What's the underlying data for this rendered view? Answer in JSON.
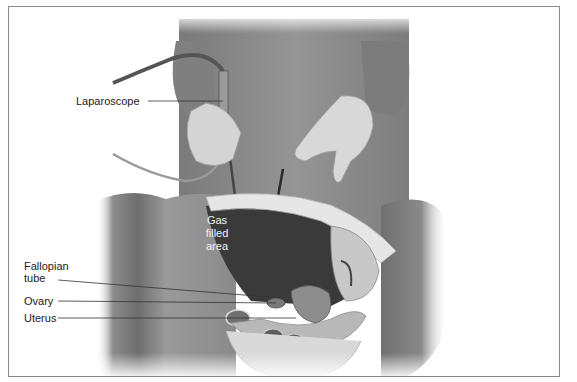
{
  "figure": {
    "caption_partial": "",
    "border_color": "#8a8a8a",
    "background": "#ffffff"
  },
  "labels": {
    "laparoscope": "Laparoscope",
    "gas_line1": "Gas",
    "gas_line2": "filled",
    "gas_line3": "area",
    "fallopian_line1": "Fallopian",
    "fallopian_line2": "tube",
    "ovary": "Ovary",
    "uterus": "Uterus"
  },
  "colors": {
    "gown": "#8e8e8e",
    "skin_glove": "#d6d6d6",
    "gas_area": "#3a3a3a",
    "abdomen": "#9a9a9a",
    "organ_light": "#c8c8c8",
    "leader_line": "#333333"
  }
}
